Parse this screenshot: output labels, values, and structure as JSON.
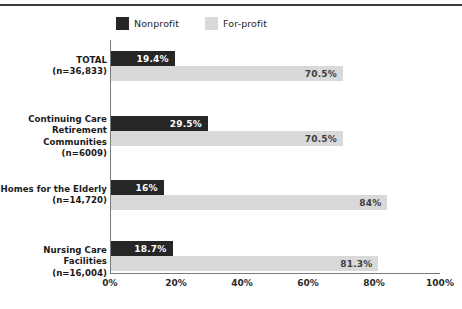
{
  "legend": {
    "entries": [
      {
        "label": "Nonprofit",
        "color": "#262626",
        "key": "nonprofit"
      },
      {
        "label": "For-profit",
        "color": "#d9d9d9",
        "key": "forprofit"
      }
    ]
  },
  "axis": {
    "ticks": [
      "0%",
      "20%",
      "40%",
      "60%",
      "80%",
      "100%"
    ],
    "min": 0,
    "max": 100
  },
  "chart_data": {
    "type": "bar",
    "orientation": "horizontal",
    "title": "",
    "subtitle": "",
    "xlabel": "",
    "ylabel": "",
    "xlim": [
      0,
      100
    ],
    "xticks": [
      0,
      20,
      40,
      60,
      80,
      100
    ],
    "xtick_labels": [
      "0%",
      "20%",
      "40%",
      "60%",
      "80%",
      "100%"
    ],
    "grid": false,
    "legend_position": "top-left",
    "categories": [
      "TOTAL",
      "Continuing Care Retirement Communities",
      "Homes for the Elderly",
      "Nursing Care Facilities"
    ],
    "category_lines": [
      [
        "TOTAL",
        "(n=36,833)"
      ],
      [
        "Continuing Care",
        "Retirement Communities",
        "(n=6009)"
      ],
      [
        "Homes for the Elderly",
        "(n=14,720)"
      ],
      [
        "Nursing Care Facilities",
        "(n=16,004)"
      ]
    ],
    "sample_sizes": [
      "(n=36,833)",
      "(n=6009)",
      "(n=14,720)",
      "(n=16,004)"
    ],
    "series": [
      {
        "name": "Nonprofit",
        "color": "#262626",
        "values": [
          19.4,
          29.5,
          16,
          18.7
        ],
        "labels": [
          "19.4%",
          "29.5%",
          "16%",
          "18.7%"
        ]
      },
      {
        "name": "For-profit",
        "color": "#d9d9d9",
        "values": [
          70.5,
          70.5,
          84,
          81.3
        ],
        "labels": [
          "70.5%",
          "70.5%",
          "84%",
          "81.3%"
        ]
      }
    ]
  }
}
